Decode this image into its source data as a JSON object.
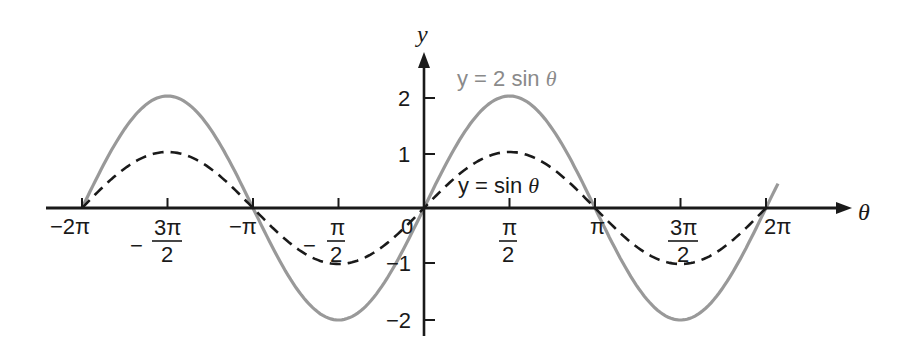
{
  "chart_data": {
    "type": "line",
    "title": "",
    "xlabel": "θ",
    "ylabel": "y",
    "xlim": [
      -6.283,
      6.6
    ],
    "ylim": [
      -2,
      2
    ],
    "grid": false,
    "x_tick_labels": [
      "−2π",
      "−3π/2",
      "−π",
      "−π/2",
      "0",
      "π/2",
      "π",
      "3π/2",
      "2π"
    ],
    "x_tick_values": [
      -6.2832,
      -4.7124,
      -3.1416,
      -1.5708,
      0,
      1.5708,
      3.1416,
      4.7124,
      6.2832
    ],
    "y_tick_labels": [
      "−2",
      "−1",
      "1",
      "2"
    ],
    "y_tick_values": [
      -2,
      -1,
      1,
      2
    ],
    "x": [
      -6.2832,
      -4.7124,
      -3.1416,
      -1.5708,
      0,
      1.5708,
      3.1416,
      4.7124,
      6.2832
    ],
    "series": [
      {
        "name": "y = 2 sin θ",
        "style": "solid",
        "color": "#999999",
        "values": [
          0,
          2,
          0,
          -2,
          0,
          2,
          0,
          -2,
          0
        ]
      },
      {
        "name": "y = sin θ",
        "style": "dashed",
        "color": "#1a1a1a",
        "values": [
          0,
          1,
          0,
          -1,
          0,
          1,
          0,
          -1,
          0
        ]
      }
    ],
    "annotations": [
      {
        "text": "y = 2 sin θ",
        "color": "#8a8a8a",
        "near": "upper right of y-axis"
      },
      {
        "text": "y = sin θ",
        "color": "#1a1a1a",
        "near": "first positive hump of sin θ"
      }
    ]
  },
  "labels": {
    "x_axis": "θ",
    "y_axis": "y",
    "curve_2sin": {
      "prefix": "y = 2 sin ",
      "var": "θ"
    },
    "curve_sin": {
      "prefix": "y = sin ",
      "var": "θ"
    },
    "x_ticks": {
      "neg_2pi": "−2π",
      "neg_3pi_2_num": "3π",
      "neg_pi": "−π",
      "neg_pi_2_num": "π",
      "zero": "0",
      "pi_2_num": "π",
      "pi": "π",
      "three_pi_2_num": "3π",
      "two_pi": "2π",
      "den": "2",
      "minus": "−"
    },
    "y_ticks": {
      "two": "2",
      "one": "1",
      "neg_one": "−1",
      "neg_two": "−2"
    }
  },
  "colors": {
    "axis": "#1a1a1a",
    "curve_2sin": "#999999",
    "curve_sin": "#1a1a1a",
    "label_2sin": "#8a8a8a"
  }
}
